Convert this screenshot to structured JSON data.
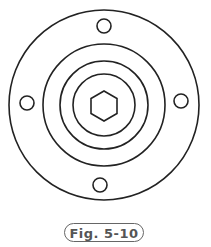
{
  "figure": {
    "caption": "Fig. 5-10",
    "stroke_color": "#222222",
    "center": [
      104,
      104
    ],
    "rings": [
      {
        "name": "outer-flange-circle",
        "r": 95
      },
      {
        "name": "ring-2",
        "r": 61
      },
      {
        "name": "ring-3",
        "r": 44
      },
      {
        "name": "ring-4",
        "r": 31
      }
    ],
    "hexagon": {
      "cx": 104,
      "cy": 106,
      "r": 15
    },
    "bolt_holes": [
      {
        "name": "bolt-hole-top",
        "cx": 104,
        "cy": 26,
        "r": 7
      },
      {
        "name": "bolt-hole-left",
        "cx": 27,
        "cy": 103,
        "r": 7
      },
      {
        "name": "bolt-hole-right",
        "cx": 181,
        "cy": 101,
        "r": 7
      },
      {
        "name": "bolt-hole-bottom",
        "cx": 100,
        "cy": 185,
        "r": 7
      }
    ]
  }
}
